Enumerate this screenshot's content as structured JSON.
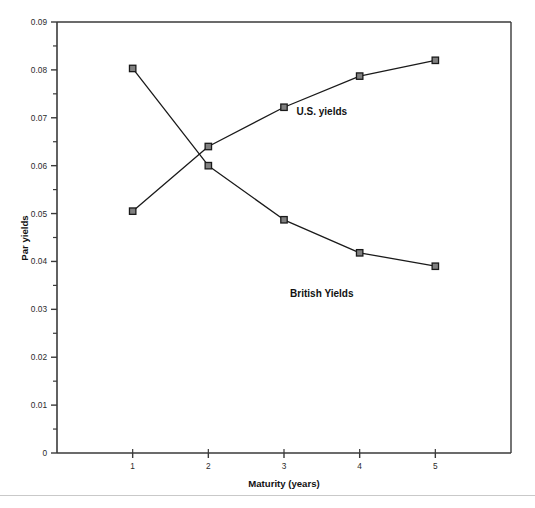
{
  "figure": {
    "background_color": "#ffffff",
    "axis_color": "#3a3a3a",
    "series_color": "#1a1a1a",
    "marker_fill": "#808080",
    "footer_rule_color": "#c9c9c9"
  },
  "chart_data": {
    "type": "line",
    "title": "",
    "xlabel": "Maturity (years)",
    "ylabel": "Par yields",
    "x": [
      1,
      2,
      3,
      4,
      5
    ],
    "xlim": [
      0,
      6
    ],
    "ylim": [
      0,
      0.09
    ],
    "grid": false,
    "legend_position": "inline-annotations",
    "x_tick_labels": [
      "1",
      "2",
      "3",
      "4",
      "5"
    ],
    "y_tick_labels": [
      "0",
      "0.01",
      "0.02",
      "0.03",
      "0.04",
      "0.05",
      "0.06",
      "0.07",
      "0.08",
      "0.09"
    ],
    "y_tick_values": [
      0,
      0.01,
      0.02,
      0.03,
      0.04,
      0.05,
      0.06,
      0.07,
      0.08,
      0.09
    ],
    "y_minor_tick_values": [
      0.005,
      0.015,
      0.025,
      0.035,
      0.045,
      0.055,
      0.065,
      0.075,
      0.085
    ],
    "series": [
      {
        "name": "U.S. yields",
        "values": [
          0.0505,
          0.064,
          0.0722,
          0.0787,
          0.082
        ],
        "marker": "square",
        "annotation": {
          "text": "U.S. yields",
          "x": 3.5,
          "y": 0.0705
        }
      },
      {
        "name": "British Yields",
        "values": [
          0.0803,
          0.06,
          0.0487,
          0.0418,
          0.039
        ],
        "marker": "square",
        "annotation": {
          "text": "British Yields",
          "x": 3.5,
          "y": 0.0325
        }
      }
    ]
  }
}
